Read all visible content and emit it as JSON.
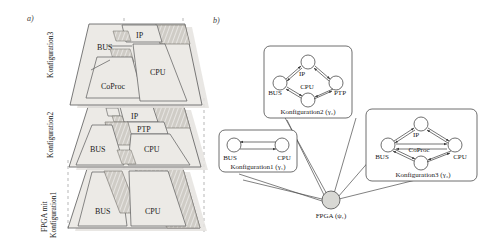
{
  "figure": {
    "panel_a_letter": "a)",
    "panel_b_letter": "b)"
  },
  "panel_a": {
    "axis_labels": [
      {
        "id": "konfiguration3",
        "text": "Konfiguration3"
      },
      {
        "id": "konfiguration2",
        "text": "Konfiguration2"
      },
      {
        "id": "fpga-mit",
        "text": "FPGA mit"
      },
      {
        "id": "konfiguration1",
        "text": "Konfiguration1"
      }
    ],
    "layers": [
      {
        "id": "layer-konfiguration3",
        "name": "Konfiguration3",
        "blocks": [
          "IP",
          "BUS",
          "CoProc",
          "CPU"
        ]
      },
      {
        "id": "layer-konfiguration2",
        "name": "Konfiguration2",
        "blocks": [
          "IP",
          "PTP",
          "BUS",
          "CPU"
        ]
      },
      {
        "id": "layer-konfiguration1",
        "name": "Konfiguration1",
        "blocks": [
          "BUS",
          "CPU"
        ]
      }
    ],
    "block_labels": {
      "ip": "IP",
      "bus": "BUS",
      "cpu": "CPU",
      "coproc": "CoProc",
      "ptp": "PTP"
    }
  },
  "panel_b": {
    "root": {
      "id": "fpga-node",
      "label": "FPGA (ψ₁)"
    },
    "graphs": [
      {
        "id": "graph-konfiguration2",
        "caption": "Konfiguration2 (γ₂)",
        "nodes": [
          "IP",
          "BUS",
          "PTP",
          "CPU"
        ],
        "node_positions": {
          "IP": "top",
          "BUS": "left",
          "PTP": "right",
          "CPU": "bottom"
        },
        "edges": [
          [
            "BUS",
            "IP"
          ],
          [
            "IP",
            "PTP"
          ],
          [
            "PTP",
            "CPU"
          ],
          [
            "CPU",
            "BUS"
          ]
        ],
        "edges_bidirectional": true
      },
      {
        "id": "graph-konfiguration1",
        "caption": "Konfiguration1 (γ₁)",
        "nodes": [
          "BUS",
          "CPU"
        ],
        "node_positions": {
          "BUS": "left",
          "CPU": "right"
        },
        "edges": [
          [
            "BUS",
            "CPU"
          ]
        ],
        "edges_bidirectional": true
      },
      {
        "id": "graph-konfiguration3",
        "caption": "Konfiguration3 (γ₃)",
        "nodes": [
          "IP",
          "BUS",
          "CPU",
          "CoProc"
        ],
        "node_positions": {
          "IP": "top",
          "BUS": "left",
          "CPU": "right",
          "CoProc": "bottom"
        },
        "edges": [
          [
            "BUS",
            "IP"
          ],
          [
            "IP",
            "CPU"
          ],
          [
            "CPU",
            "CoProc"
          ],
          [
            "CoProc",
            "BUS"
          ],
          [
            "BUS",
            "CPU"
          ]
        ],
        "edges_bidirectional": true
      }
    ]
  },
  "colors": {
    "fill_light": "#eceae6",
    "fill_mid": "#d9d6d1",
    "fill_dark": "#b8b5ae",
    "stroke": "#595959",
    "dashed": "#8c8c8c",
    "shadow": "#e4e2de",
    "node_fill": "#ffffff",
    "root_fill": "#d8d8d4"
  }
}
